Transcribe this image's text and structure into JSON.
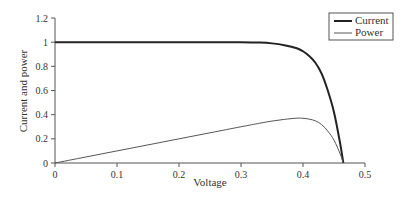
{
  "chart_data": {
    "type": "line",
    "title": "",
    "xlabel": "Voltage",
    "ylabel": "Current and power",
    "xlim": [
      0,
      0.5
    ],
    "ylim": [
      0,
      1.2
    ],
    "xticks": [
      "0",
      "0.1",
      "0.2",
      "0.3",
      "0.4",
      "0.5"
    ],
    "yticks": [
      "0",
      "0.2",
      "0.4",
      "0.6",
      "0.8",
      "1",
      "1.2"
    ],
    "grid": false,
    "legend_position": "top-right",
    "series": [
      {
        "name": "Current",
        "x": [
          0,
          0.05,
          0.1,
          0.15,
          0.2,
          0.25,
          0.3,
          0.33,
          0.35,
          0.37,
          0.39,
          0.4,
          0.41,
          0.42,
          0.43,
          0.44,
          0.45,
          0.46,
          0.465
        ],
        "y": [
          1.0,
          1.0,
          1.0,
          1.0,
          1.0,
          1.0,
          1.0,
          0.997,
          0.99,
          0.975,
          0.95,
          0.925,
          0.885,
          0.83,
          0.74,
          0.6,
          0.42,
          0.16,
          0.0
        ],
        "color": "#222222",
        "line_width": 2
      },
      {
        "name": "Power",
        "x": [
          0,
          0.05,
          0.1,
          0.15,
          0.2,
          0.25,
          0.3,
          0.33,
          0.35,
          0.37,
          0.39,
          0.4,
          0.41,
          0.42,
          0.43,
          0.44,
          0.45,
          0.46,
          0.465
        ],
        "y": [
          0.0,
          0.05,
          0.1,
          0.15,
          0.2,
          0.25,
          0.3,
          0.329,
          0.347,
          0.361,
          0.371,
          0.37,
          0.363,
          0.349,
          0.318,
          0.264,
          0.189,
          0.074,
          0.0
        ],
        "color": "#555555",
        "line_width": 1
      }
    ]
  }
}
